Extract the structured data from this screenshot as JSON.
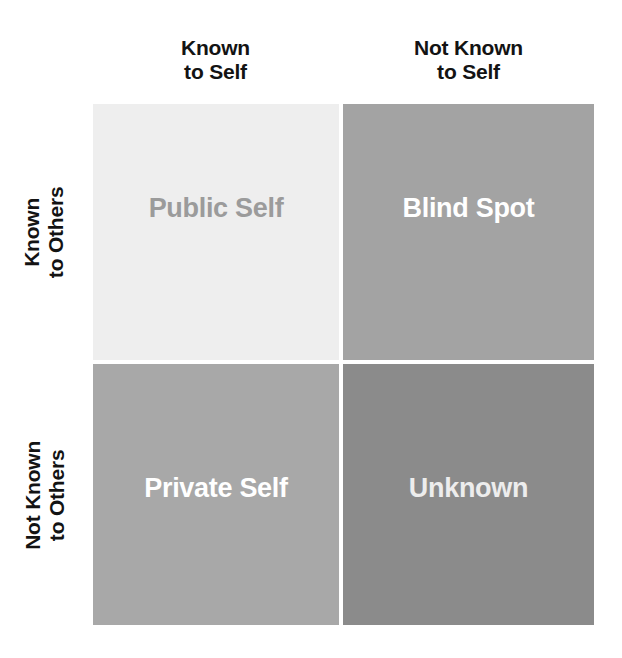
{
  "diagram": {
    "type": "johari-window",
    "columns": [
      {
        "id": "known-to-self",
        "line1": "Known",
        "line2": "to Self"
      },
      {
        "id": "not-known-to-self",
        "line1": "Not Known",
        "line2": "to Self"
      }
    ],
    "rows": [
      {
        "id": "known-to-others",
        "line1": "Known",
        "line2": "to Others"
      },
      {
        "id": "not-known-to-others",
        "line1": "Not Known",
        "line2": "to Others"
      }
    ],
    "quadrants": [
      {
        "id": "public-self",
        "label": "Public Self",
        "row": "known-to-others",
        "column": "known-to-self",
        "fill": "#eeeeee",
        "text_color": "#9b9b9b"
      },
      {
        "id": "blind-spot",
        "label": "Blind Spot",
        "row": "known-to-others",
        "column": "not-known-to-self",
        "fill": "#a3a3a3",
        "text_color": "#ffffff"
      },
      {
        "id": "private-self",
        "label": "Private Self",
        "row": "not-known-to-others",
        "column": "known-to-self",
        "fill": "#a8a8a8",
        "text_color": "#ffffff"
      },
      {
        "id": "unknown",
        "label": "Unknown",
        "row": "not-known-to-others",
        "column": "not-known-to-self",
        "fill": "#8b8b8b",
        "text_color": "#ededed"
      }
    ],
    "header_text_color": "#131313",
    "background": "#ffffff",
    "gutter_color": "#ffffff"
  }
}
